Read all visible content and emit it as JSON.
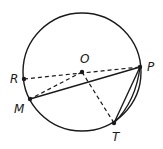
{
  "diagram": {
    "type": "circle-geometry",
    "circle": {
      "center": "O",
      "cx": 82,
      "cy": 72,
      "r": 59
    },
    "points": {
      "O": {
        "label": "O",
        "x": 82,
        "y": 72,
        "lx": 80,
        "ly": 63
      },
      "P": {
        "label": "P",
        "x": 140,
        "y": 67,
        "lx": 147,
        "ly": 71
      },
      "R": {
        "label": "R",
        "x": 24,
        "y": 79,
        "lx": 10,
        "ly": 83
      },
      "M": {
        "label": "M",
        "x": 30,
        "y": 99,
        "lx": 14,
        "ly": 113
      },
      "T": {
        "label": "T",
        "x": 114,
        "y": 123,
        "lx": 112,
        "ly": 141
      }
    },
    "segments": [
      {
        "from": "M",
        "to": "P",
        "style": "solid"
      },
      {
        "from": "P",
        "to": "T",
        "style": "solid",
        "double": true
      },
      {
        "from": "R",
        "to": "P",
        "style": "dashed"
      },
      {
        "from": "O",
        "to": "M",
        "style": "dashed"
      },
      {
        "from": "O",
        "to": "T",
        "style": "dashed"
      }
    ],
    "colors": {
      "stroke": "#1a1a1a",
      "background": "#ffffff"
    }
  }
}
